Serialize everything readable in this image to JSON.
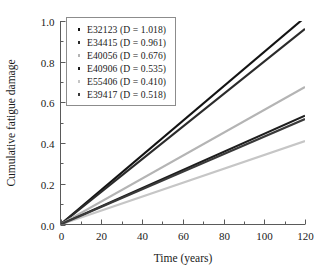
{
  "chart_data": {
    "type": "line",
    "title": "",
    "xlabel": "Time (years)",
    "ylabel": "Cumulative fatigue damage",
    "xlim": [
      0,
      120
    ],
    "ylim": [
      0.0,
      1.0
    ],
    "xticks": [
      0,
      20,
      40,
      60,
      80,
      100,
      120
    ],
    "xtick_labels": [
      "0",
      "20",
      "40",
      "60",
      "80",
      "100",
      "120"
    ],
    "yticks": [
      0.0,
      0.2,
      0.4,
      0.6,
      0.8,
      1.0
    ],
    "ytick_labels": [
      "0.0",
      "0.2",
      "0.4",
      "0.6",
      "0.8",
      "1.0"
    ],
    "minor_ticks": true,
    "grid": false,
    "legend_position": "upper-left",
    "x": [
      0,
      120
    ],
    "series": [
      {
        "name": "E32123",
        "legend_label": "E32123 (D = 1.018)",
        "D": 1.018,
        "values": [
          0.0,
          1.018
        ],
        "color": "#131313",
        "marker": "square"
      },
      {
        "name": "E34415",
        "legend_label": "E34415 (D = 0.961)",
        "D": 0.961,
        "values": [
          0.0,
          0.961
        ],
        "color": "#2b2b2b",
        "marker": "square"
      },
      {
        "name": "E40056",
        "legend_label": "E40056 (D = 0.676)",
        "D": 0.676,
        "values": [
          0.0,
          0.676
        ],
        "color": "#b4b4b4",
        "marker": "square"
      },
      {
        "name": "E40906",
        "legend_label": "E40906 (D = 0.535)",
        "D": 0.535,
        "values": [
          0.0,
          0.535
        ],
        "color": "#1d1d1d",
        "marker": "square"
      },
      {
        "name": "E55406",
        "legend_label": "E55406 (D = 0.410)",
        "D": 0.41,
        "values": [
          0.0,
          0.41
        ],
        "color": "#c6c6c6",
        "marker": "square"
      },
      {
        "name": "E39417",
        "legend_label": "E39417 (D = 0.518)",
        "D": 0.518,
        "values": [
          0.0,
          0.518
        ],
        "color": "#3a3a3a",
        "marker": "square"
      }
    ]
  }
}
